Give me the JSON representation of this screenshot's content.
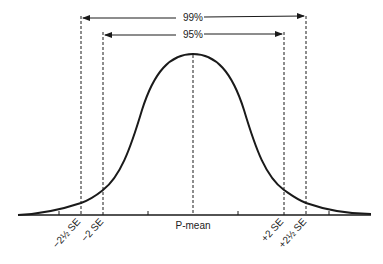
{
  "diagram": {
    "type": "normal-distribution",
    "colors": {
      "ink": "#1a1a1a",
      "background": "#ffffff"
    },
    "intervals": [
      {
        "label": "99%",
        "from": "-2½ SE",
        "to": "+2½ SE"
      },
      {
        "label": "95%",
        "from": "-2 SE",
        "to": "+2 SE"
      }
    ],
    "axis_labels": {
      "minus_2_5_se": "−2½ SE",
      "minus_2_se": "−2 SE",
      "mean": "P-mean",
      "plus_2_se": "+2 SE",
      "plus_2_5_se": "+2½ SE"
    },
    "interval_labels": {
      "outer": "99%",
      "inner": "95%"
    }
  }
}
